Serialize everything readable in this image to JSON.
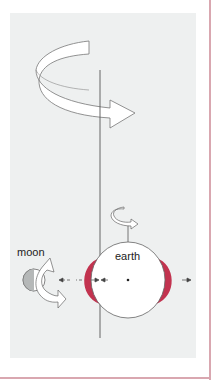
{
  "diagram": {
    "labels": {
      "moon": "moon",
      "earth": "earth"
    },
    "colors": {
      "panel_bg": "#eef0f0",
      "frame": "#d9a7b0",
      "tidal_bulge": "#c2334f",
      "moon_shade": "#b5b8b8",
      "outline": "#666666"
    },
    "elements": [
      "large-rotation-arrow",
      "rotation-axis-line",
      "small-earth-spin-arrow",
      "earth-circle",
      "tidal-bulge-left",
      "tidal-bulge-right",
      "moon-circle",
      "moon-orbit-arrow",
      "tidal-force-arrows"
    ]
  }
}
